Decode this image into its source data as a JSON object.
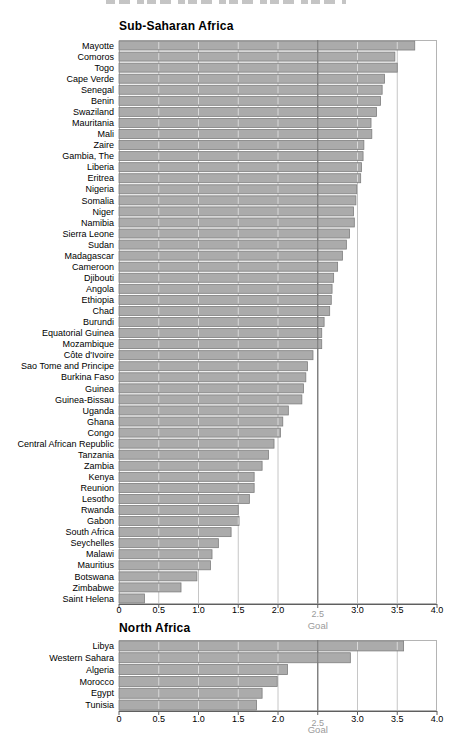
{
  "style": {
    "bar_fill": "#ababab",
    "bar_border": "#7e7e7e",
    "grid": "#c6c6c6",
    "goal_line": "#787878",
    "axis": "#5f5f5f",
    "frame": "#b4b4b4",
    "text": "#000000",
    "muted_text": "#9a9a9a",
    "bar_tick_overlay": "#ffffff"
  },
  "chart_data": [
    {
      "type": "bar",
      "orientation": "horizontal",
      "title": "Sub-Saharan Africa",
      "xlabel": "",
      "xlim": [
        0,
        4
      ],
      "xticks": [
        0,
        0.5,
        1,
        1.5,
        2,
        2.5,
        3,
        3.5,
        4
      ],
      "xtick_labels": [
        "0",
        "0.5",
        "1.0",
        "1.5",
        "2.0",
        "2.5",
        "3.0",
        "3.5",
        "4.0"
      ],
      "goal": {
        "value": 2.5,
        "label": "Goal"
      },
      "grid": true,
      "categories": [
        "Mayotte",
        "Comoros",
        "Togo",
        "Cape Verde",
        "Senegal",
        "Benin",
        "Swaziland",
        "Mauritania",
        "Mali",
        "Zaire",
        "Gambia, The",
        "Liberia",
        "Eritrea",
        "Nigeria",
        "Somalia",
        "Niger",
        "Namibia",
        "Sierra Leone",
        "Sudan",
        "Madagascar",
        "Cameroon",
        "Djibouti",
        "Angola",
        "Ethiopia",
        "Chad",
        "Burundi",
        "Equatorial Guinea",
        "Mozambique",
        "Côte d'Ivoire",
        "Sao Tome and Principe",
        "Burkina Faso",
        "Guinea",
        "Guinea-Bissau",
        "Uganda",
        "Ghana",
        "Congo",
        "Central African Republic",
        "Tanzania",
        "Zambia",
        "Kenya",
        "Reunion",
        "Lesotho",
        "Rwanda",
        "Gabon",
        "South Africa",
        "Seychelles",
        "Malawi",
        "Mauritius",
        "Botswana",
        "Zimbabwe",
        "Saint Helena"
      ],
      "values": [
        3.72,
        3.47,
        3.5,
        3.34,
        3.31,
        3.29,
        3.24,
        3.17,
        3.18,
        3.08,
        3.07,
        3.05,
        3.04,
        2.99,
        2.98,
        2.95,
        2.96,
        2.9,
        2.86,
        2.81,
        2.75,
        2.7,
        2.68,
        2.67,
        2.65,
        2.58,
        2.55,
        2.55,
        2.44,
        2.37,
        2.35,
        2.32,
        2.3,
        2.13,
        2.06,
        2.03,
        1.95,
        1.88,
        1.8,
        1.7,
        1.7,
        1.64,
        1.5,
        1.51,
        1.41,
        1.25,
        1.17,
        1.15,
        0.98,
        0.78,
        0.32
      ]
    },
    {
      "type": "bar",
      "orientation": "horizontal",
      "title": "North Africa",
      "xlabel": "",
      "xlim": [
        0,
        4
      ],
      "xticks": [
        0,
        0.5,
        1,
        1.5,
        2,
        2.5,
        3,
        3.5,
        4
      ],
      "xtick_labels": [
        "0",
        "0.5",
        "1.0",
        "1.5",
        "2.0",
        "2.5",
        "3.0",
        "3.5",
        "4.0"
      ],
      "goal": {
        "value": 2.5,
        "label": "Goal"
      },
      "grid": true,
      "categories": [
        "Libya",
        "Western Sahara",
        "Algeria",
        "Morocco",
        "Egypt",
        "Tunisia"
      ],
      "values": [
        3.58,
        2.91,
        2.12,
        1.99,
        1.8,
        1.73
      ]
    }
  ]
}
